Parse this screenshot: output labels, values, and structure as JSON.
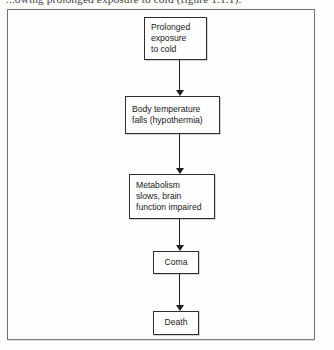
{
  "page": {
    "caption_text": "...owing prolonged exposure to cold (figure 1.1.1).",
    "background_color": "#fdfdfc",
    "frame_border_color": "#6e6e6e"
  },
  "figure": {
    "box_border_color": "#2e2e2e",
    "arrow_color": "#1d1d1d",
    "boxes": [
      {
        "id": "exposure",
        "lines": [
          "Prolonged",
          "exposure",
          "to cold"
        ]
      },
      {
        "id": "hypothermia",
        "lines": [
          "Body temperature",
          "falls (hypothermia)"
        ]
      },
      {
        "id": "metabolism",
        "lines": [
          "Metabolism",
          "slows, brain",
          "function impaired"
        ]
      },
      {
        "id": "coma",
        "lines": [
          "Coma"
        ]
      },
      {
        "id": "death",
        "lines": [
          "Death"
        ]
      }
    ],
    "connectors": [
      {
        "id": "arrow-1",
        "from": "exposure",
        "to": "hypothermia",
        "direction": "down"
      },
      {
        "id": "arrow-2",
        "from": "hypothermia",
        "to": "metabolism",
        "direction": "down"
      },
      {
        "id": "arrow-3",
        "from": "metabolism",
        "to": "coma",
        "direction": "down"
      },
      {
        "id": "arrow-4",
        "from": "coma",
        "to": "death",
        "direction": "down"
      }
    ]
  }
}
